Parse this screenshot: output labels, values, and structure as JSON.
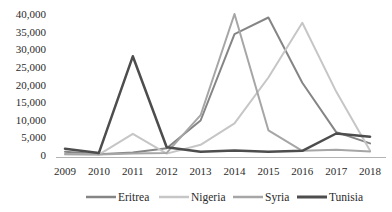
{
  "chart_data": {
    "type": "line",
    "title": "",
    "xlabel": "",
    "ylabel": "",
    "grid": false,
    "legend_position": "bottom",
    "categories": [
      "2009",
      "2010",
      "2011",
      "2012",
      "2013",
      "2014",
      "2015",
      "2016",
      "2017",
      "2018"
    ],
    "series": [
      {
        "name": "Eritrea",
        "color": "#858585",
        "width": 2,
        "values": [
          900,
          200,
          700,
          1900,
          9800,
          34300,
          39000,
          20500,
          6500,
          3300
        ]
      },
      {
        "name": "Nigeria",
        "color": "#c6c6c6",
        "width": 2,
        "values": [
          100,
          100,
          6000,
          400,
          2900,
          9000,
          22000,
          37500,
          18000,
          1200
        ]
      },
      {
        "name": "Syria",
        "color": "#a6a6a6",
        "width": 2,
        "values": [
          300,
          100,
          400,
          600,
          11300,
          40000,
          7000,
          1200,
          1500,
          1000
        ]
      },
      {
        "name": "Tunisia",
        "color": "#4d4d4d",
        "width": 2.5,
        "values": [
          1800,
          600,
          28000,
          2200,
          900,
          1300,
          900,
          1200,
          6100,
          5200
        ]
      }
    ],
    "ylim": [
      0,
      40000
    ],
    "ytick_step": 5000,
    "ytick_labels": [
      "0",
      "5,000",
      "10,000",
      "15,000",
      "20,000",
      "25,000",
      "30,000",
      "35,000",
      "40,000"
    ]
  },
  "colors": {
    "background": "#ffffff",
    "axis_line": "#b3b3b3",
    "text": "#2b2b2b"
  }
}
